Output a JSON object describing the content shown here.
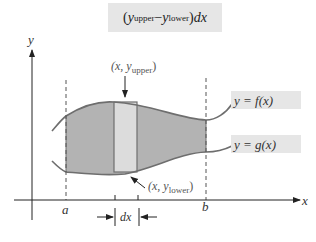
{
  "formula": {
    "open_paren": "(",
    "y1": "y",
    "sub1": "upper",
    "minus": " − ",
    "y2": "y",
    "sub2": "lower",
    "close_paren": ")",
    "dx": " dx"
  },
  "axes": {
    "x_label": "x",
    "y_label": "y"
  },
  "bounds": {
    "a_label": "a",
    "b_label": "b"
  },
  "curves": {
    "upper_label": "y = f(x)",
    "lower_label": "y = g(x)"
  },
  "annotations": {
    "upper_point_prefix": "(x, y",
    "upper_point_sub": "upper",
    "upper_point_suffix": ")",
    "lower_point_prefix": "(x, y",
    "lower_point_sub": "lower",
    "lower_point_suffix": ")",
    "width_label": "dx"
  },
  "colors": {
    "region_fill": "#b3b3b3",
    "strip_fill": "#dcdcdc",
    "curve_stroke": "#6e6e6e",
    "label_bg": "#e6e6e6"
  }
}
